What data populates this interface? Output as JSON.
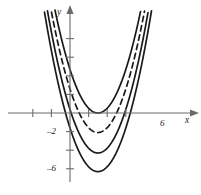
{
  "figure": {
    "name": "family-of-parabolas",
    "background": "#ffffff",
    "ink": "#1a1a1a"
  },
  "axes": {
    "x_label": "x",
    "y_label": "y",
    "x_tick_labels": [
      {
        "value": 6,
        "text": "6"
      }
    ],
    "x_unlabeled_ticks": [
      -4,
      -2,
      2,
      4
    ],
    "y_tick_labels": [
      {
        "value": -2,
        "text": "–2"
      },
      {
        "value": -6,
        "text": "–6"
      }
    ],
    "y_unlabeled_ticks": [
      2,
      4,
      6,
      8,
      -4
    ],
    "x_range": [
      -6.5,
      13.0
    ],
    "y_range": [
      -8.0,
      11.5
    ],
    "grid": false,
    "arrows": [
      "x-positive",
      "y-positive"
    ]
  },
  "chart_data": {
    "type": "line",
    "title": "",
    "xlabel": "x",
    "ylabel": "y",
    "xlim": [
      -6.5,
      13.0
    ],
    "ylim": [
      -8.0,
      11.5
    ],
    "grid": false,
    "legend": "none",
    "series": [
      {
        "name": "parabola-1",
        "style": "solid",
        "vertex": [
          3.0,
          0.0
        ],
        "leading_coefficient": 0.52,
        "x": [
          -3.0,
          -2.0,
          -1.0,
          0.0,
          1.0,
          2.0,
          3.0,
          4.0,
          5.0,
          6.0,
          7.0,
          8.0,
          9.0
        ],
        "y": [
          18.7,
          13.0,
          8.3,
          4.7,
          2.1,
          0.5,
          0.0,
          0.5,
          2.1,
          4.7,
          8.3,
          13.0,
          18.7
        ]
      },
      {
        "name": "parabola-2",
        "style": "dashed",
        "vertex": [
          3.0,
          -2.1
        ],
        "leading_coefficient": 0.52,
        "x": [
          -3.0,
          -2.0,
          -1.0,
          0.0,
          1.0,
          2.0,
          3.0,
          4.0,
          5.0,
          6.0,
          7.0,
          8.0,
          9.0
        ],
        "y": [
          16.6,
          10.9,
          6.2,
          2.6,
          0.0,
          -1.6,
          -2.1,
          -1.6,
          0.0,
          2.6,
          6.2,
          10.9,
          16.6
        ]
      },
      {
        "name": "parabola-3",
        "style": "solid",
        "vertex": [
          3.0,
          -4.3
        ],
        "leading_coefficient": 0.52,
        "x": [
          -3.0,
          -2.0,
          -1.0,
          0.0,
          1.0,
          2.0,
          3.0,
          4.0,
          5.0,
          6.0,
          7.0,
          8.0,
          9.0
        ],
        "y": [
          14.4,
          8.7,
          4.0,
          0.4,
          -2.2,
          -3.8,
          -4.3,
          -3.8,
          -2.2,
          0.4,
          4.0,
          8.7,
          14.4
        ]
      },
      {
        "name": "parabola-4",
        "style": "solid",
        "vertex": [
          3.0,
          -6.3
        ],
        "leading_coefficient": 0.52,
        "x": [
          -3.0,
          -2.0,
          -1.0,
          0.0,
          1.0,
          2.0,
          3.0,
          4.0,
          5.0,
          6.0,
          7.0,
          8.0,
          9.0
        ],
        "y": [
          12.4,
          6.7,
          2.0,
          -1.6,
          -4.2,
          -5.8,
          -6.3,
          -5.8,
          -4.2,
          -1.6,
          2.0,
          6.7,
          12.4
        ]
      }
    ]
  }
}
